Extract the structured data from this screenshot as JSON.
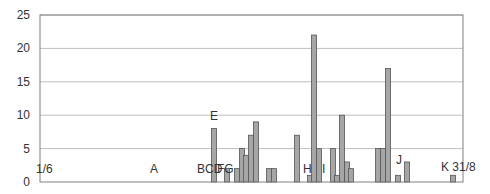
{
  "chart_data": {
    "type": "bar",
    "title": "",
    "xlabel": "",
    "ylabel": "",
    "ylim": [
      0,
      25
    ],
    "yticks": [
      0,
      5,
      10,
      15,
      20,
      25
    ],
    "grid": true,
    "legend": null,
    "colors": {
      "bar_fill": "#a6a6a6",
      "bar_stroke": "#555555",
      "grid": "#bfbfbf",
      "axis": "#808080"
    },
    "plot_area": {
      "left": 40,
      "top": 15,
      "right": 463,
      "bottom": 182
    },
    "bars": [
      {
        "x": 214,
        "value": 8
      },
      {
        "x": 227,
        "value": 2
      },
      {
        "x": 237,
        "value": 2
      },
      {
        "x": 242,
        "value": 5
      },
      {
        "x": 246,
        "value": 4
      },
      {
        "x": 251,
        "value": 7
      },
      {
        "x": 256,
        "value": 9
      },
      {
        "x": 269,
        "value": 2
      },
      {
        "x": 274,
        "value": 2
      },
      {
        "x": 297,
        "value": 7
      },
      {
        "x": 310,
        "value": 1
      },
      {
        "x": 314,
        "value": 22
      },
      {
        "x": 319,
        "value": 5
      },
      {
        "x": 333,
        "value": 5
      },
      {
        "x": 337,
        "value": 1
      },
      {
        "x": 342,
        "value": 10
      },
      {
        "x": 347,
        "value": 3
      },
      {
        "x": 351,
        "value": 2
      },
      {
        "x": 378,
        "value": 5
      },
      {
        "x": 383,
        "value": 5
      },
      {
        "x": 388,
        "value": 17
      },
      {
        "x": 398,
        "value": 1
      },
      {
        "x": 407,
        "value": 3
      },
      {
        "x": 453,
        "value": 1
      }
    ],
    "annotations": [
      {
        "text": "1/6",
        "x": 36,
        "y": 173
      },
      {
        "text": "A",
        "x": 150,
        "y": 173
      },
      {
        "text": "BCD",
        "x": 197,
        "y": 173
      },
      {
        "text": "FG",
        "x": 217,
        "y": 173
      },
      {
        "text": "E",
        "x": 210,
        "y": 120
      },
      {
        "text": "H",
        "x": 303,
        "y": 173
      },
      {
        "text": "I",
        "x": 322,
        "y": 173
      },
      {
        "text": "J",
        "x": 396,
        "y": 164
      },
      {
        "text": "K 31/8",
        "x": 441,
        "y": 171
      }
    ]
  }
}
